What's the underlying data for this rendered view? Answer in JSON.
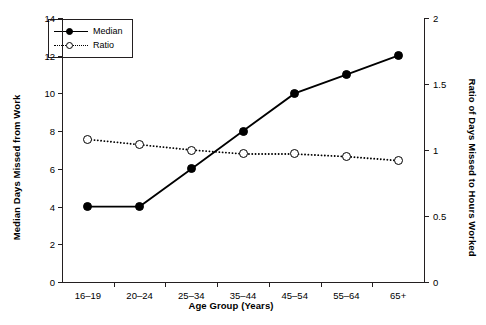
{
  "chart_data": {
    "type": "line",
    "title": "",
    "xlabel": "Age Group (Years)",
    "ylabel": "Median Days Missed from Work",
    "ylabel_right": "Ratio of Days Missed to Hours Worked",
    "categories": [
      "16–19",
      "20–24",
      "25–34",
      "35–44",
      "45–54",
      "55–64",
      "65+"
    ],
    "ylim": [
      0,
      14
    ],
    "ylim_right": [
      0,
      2
    ],
    "yticks": [
      "0",
      "2",
      "4",
      "6",
      "8",
      "10",
      "12",
      "14"
    ],
    "ytick_values": [
      0,
      2,
      4,
      6,
      8,
      10,
      12,
      14
    ],
    "yticks_right": [
      "0",
      "0.5",
      "1",
      "1.5",
      "2"
    ],
    "ytick_values_right": [
      0,
      0.5,
      1,
      1.5,
      2
    ],
    "grid": false,
    "legend_position": "upper-left",
    "series": [
      {
        "name": "Median",
        "axis": "left",
        "line_style": "solid",
        "marker": "filled-circle",
        "color": "#000000",
        "values": [
          4,
          4,
          6,
          8,
          10,
          11,
          12
        ]
      },
      {
        "name": "Ratio",
        "axis": "right",
        "line_style": "dotted",
        "marker": "open-circle",
        "color": "#000000",
        "values": [
          1.08,
          1.04,
          1.0,
          0.97,
          0.97,
          0.95,
          0.92
        ]
      }
    ]
  },
  "legend": {
    "items": [
      {
        "label": "Median"
      },
      {
        "label": "Ratio"
      }
    ]
  },
  "colors": {
    "axis": "#231f20",
    "ink": "#000000",
    "background": "#ffffff"
  }
}
